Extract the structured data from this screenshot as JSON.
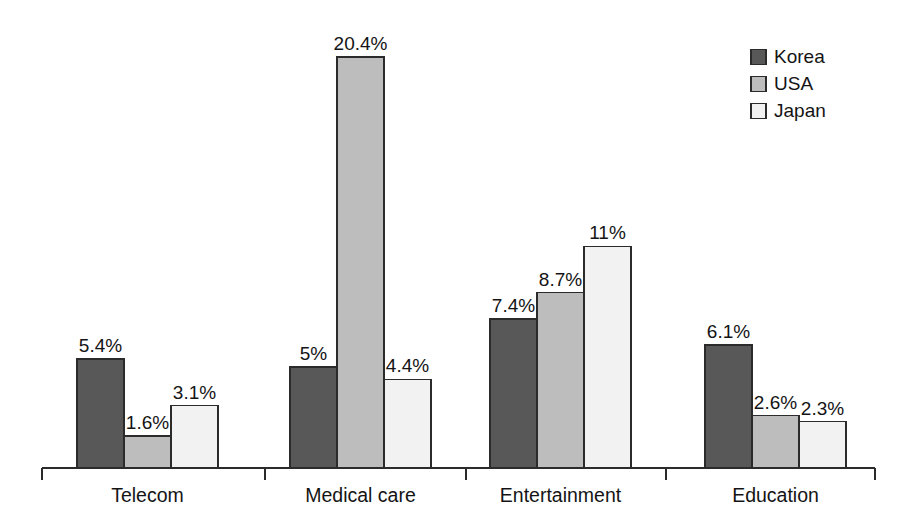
{
  "chart_data": {
    "type": "bar",
    "title": "",
    "subtitle": "",
    "xlabel": "",
    "ylabel": "",
    "grid": false,
    "axis": {
      "y_visible": false,
      "x_visible": true,
      "ylim": [
        0,
        20.4
      ]
    },
    "legend": {
      "position": "top-right",
      "entries": [
        {
          "name": "Korea",
          "color": "#585858"
        },
        {
          "name": "USA",
          "color": "#bdbdbd"
        },
        {
          "name": "Japan",
          "color": "#f2f2f2"
        }
      ]
    },
    "categories": [
      "Telecom",
      "Medical care",
      "Entertainment",
      "Education"
    ],
    "series": [
      {
        "name": "Korea",
        "color": "#585858",
        "values": [
          5.4,
          5,
          7.4,
          6.1
        ],
        "labels": [
          "5.4%",
          "5%",
          "7.4%",
          "6.1%"
        ]
      },
      {
        "name": "USA",
        "color": "#bdbdbd",
        "values": [
          1.6,
          20.4,
          8.7,
          2.6
        ],
        "labels": [
          "1.6%",
          "20.4%",
          "8.7%",
          "2.6%"
        ]
      },
      {
        "name": "Japan",
        "color": "#f2f2f2",
        "values": [
          3.1,
          4.4,
          11,
          2.3
        ],
        "labels": [
          "3.1%",
          "4.4%",
          "11%",
          "2.3%"
        ]
      }
    ],
    "value_unit": "%"
  },
  "geometry": {
    "baseline_y": 468,
    "axis_x_start": 42,
    "axis_x_end": 875,
    "px_per_unit": 20.15,
    "bar_width": 47,
    "group_starts": [
      77,
      290,
      490,
      705
    ],
    "tick_positions": [
      42,
      265,
      466,
      666,
      875
    ],
    "tick_length": 12,
    "legend_x": 751,
    "legend_y": 57,
    "legend_row_height": 27,
    "legend_swatch_size": 15
  }
}
